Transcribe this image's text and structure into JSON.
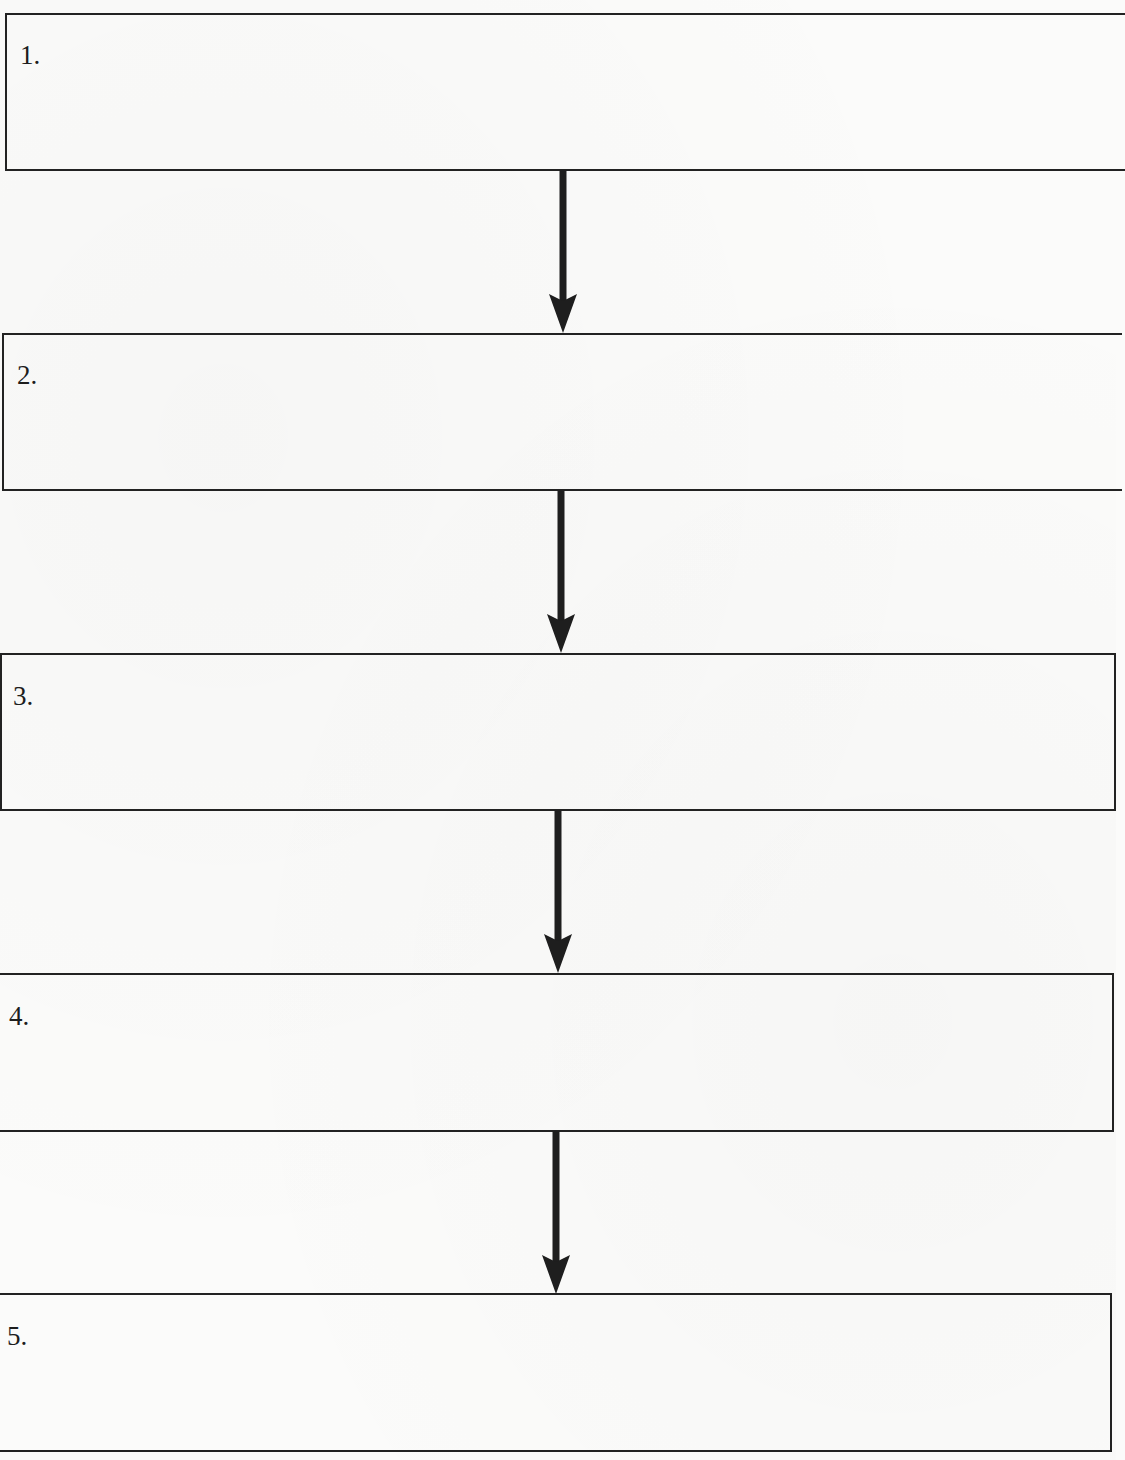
{
  "diagram": {
    "type": "vertical-flowchart",
    "steps": [
      {
        "label": "1.",
        "text": ""
      },
      {
        "label": "2.",
        "text": ""
      },
      {
        "label": "3.",
        "text": ""
      },
      {
        "label": "4.",
        "text": ""
      },
      {
        "label": "5.",
        "text": ""
      }
    ],
    "connectors": [
      {
        "from": "1.",
        "to": "2.",
        "style": "arrow-down"
      },
      {
        "from": "2.",
        "to": "3.",
        "style": "arrow-down"
      },
      {
        "from": "3.",
        "to": "4.",
        "style": "arrow-down"
      },
      {
        "from": "4.",
        "to": "5.",
        "style": "arrow-down"
      }
    ],
    "colors": {
      "line": "#222222",
      "background": "#fbfbfa"
    }
  }
}
